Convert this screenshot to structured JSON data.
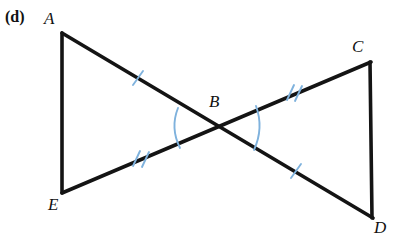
{
  "figure": {
    "part_label": "(d)",
    "background_color": "#ffffff",
    "line_color": "#141414",
    "mark_color": "#7fb2dd",
    "vertices": [
      {
        "id": "A",
        "label": "A",
        "x": 62,
        "y": 33
      },
      {
        "id": "B",
        "label": "B",
        "x": 218,
        "y": 128
      },
      {
        "id": "C",
        "label": "C",
        "x": 370,
        "y": 62
      },
      {
        "id": "D",
        "label": "D",
        "x": 372,
        "y": 218
      },
      {
        "id": "E",
        "label": "E",
        "x": 62,
        "y": 193
      }
    ],
    "segments": [
      {
        "id": "AE",
        "from": "A",
        "to": "E",
        "ticks": 0
      },
      {
        "id": "AD",
        "from": "A",
        "to": "D",
        "ticks": 0,
        "note": "passes through B; AB has 1 tick, BD has 1 tick"
      },
      {
        "id": "EC",
        "from": "E",
        "to": "C",
        "ticks": 0,
        "note": "passes through B; EB has 2 ticks, BC has 2 ticks"
      },
      {
        "id": "CD",
        "from": "C",
        "to": "D",
        "ticks": 0
      }
    ],
    "tick_marks": [
      {
        "segment": "AB",
        "count": 1,
        "x": 138,
        "y": 78
      },
      {
        "segment": "BC",
        "count": 2,
        "x": 292,
        "y": 93
      },
      {
        "segment": "BE",
        "count": 2,
        "x": 140,
        "y": 158
      },
      {
        "segment": "BD",
        "count": 1,
        "x": 296,
        "y": 171
      }
    ],
    "angle_arcs": [
      {
        "id": "angle-ABE",
        "at": "B",
        "side": "left",
        "count": 1,
        "color": "#7fb2dd"
      },
      {
        "id": "angle-CBD",
        "at": "B",
        "side": "right",
        "count": 1,
        "color": "#7fb2dd"
      }
    ]
  }
}
